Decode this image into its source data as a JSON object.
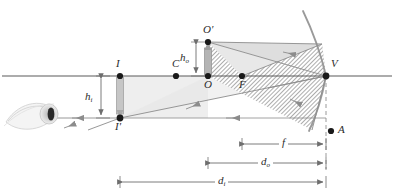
{
  "figure": {
    "colors": {
      "axis": "#5a5a5a",
      "ray": "#8c8c8c",
      "mirror": "#9a9a9a",
      "point": "#1a1a1a",
      "incident_fill": "#dcdcdc",
      "reflected_hatch": "#8a8a8a",
      "object_arrow": "#b4b4b4",
      "image_arrow": "#c0c0c0",
      "dimension": "#6e6e6e",
      "label": "#2b2b2b",
      "dashed": "#9a9a9a",
      "eye": "#cfcfcf"
    }
  },
  "labels": {
    "image_top": "I",
    "image_bottom": "I′",
    "center_of_curvature": "C",
    "object_top": "O′",
    "object_base": "O",
    "focal_point": "F",
    "vertex": "V",
    "aperture_point": "A",
    "object_height": {
      "base": "h",
      "sub": "o"
    },
    "image_height": {
      "base": "h",
      "sub": "i"
    }
  },
  "dimensions": [
    {
      "name": "focal-length",
      "base": "f",
      "sub": ""
    },
    {
      "name": "object-distance",
      "base": "d",
      "sub": "o"
    },
    {
      "name": "image-distance",
      "base": "d",
      "sub": "i"
    }
  ],
  "elements": {
    "optical_axis": "principal-axis",
    "mirror": "concave-mirror-arc",
    "eye": "observer-eye",
    "object": "upright-object-arrow",
    "image": "inverted-virtual-image-arrow"
  }
}
